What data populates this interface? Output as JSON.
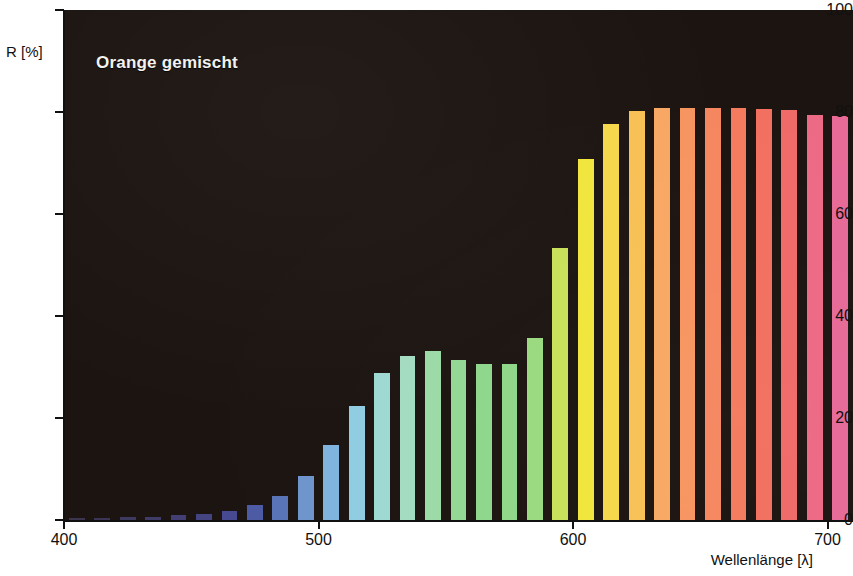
{
  "chart_data": {
    "type": "bar",
    "title": "Orange gemischt",
    "xlabel": "Wellenlänge [λ]",
    "ylabel": "R [%]",
    "xlim": [
      400,
      710
    ],
    "ylim": [
      0,
      100
    ],
    "grid": false,
    "legend": null,
    "background_color": "#1c1410",
    "x_tick_values": [
      400,
      500,
      600,
      700
    ],
    "x_tick_labels": [
      "400",
      "500",
      "600",
      "700"
    ],
    "y_tick_values": [
      0,
      20,
      40,
      60,
      80,
      100
    ],
    "y_tick_labels": [
      "0",
      "20",
      "40",
      "60",
      "80",
      "100"
    ],
    "x": [
      400,
      410,
      420,
      430,
      440,
      450,
      460,
      470,
      480,
      490,
      500,
      510,
      520,
      530,
      540,
      550,
      560,
      570,
      580,
      590,
      600,
      610,
      620,
      630,
      640,
      650,
      660,
      670,
      680,
      690,
      700
    ],
    "values": [
      0.4,
      0.4,
      0.5,
      0.6,
      0.9,
      1.2,
      1.7,
      2.9,
      4.7,
      8.6,
      14.8,
      22.4,
      28.9,
      32.2,
      33.2,
      31.4,
      30.6,
      30.5,
      35.6,
      53.3,
      70.8,
      77.7,
      80.2,
      80.7,
      80.8,
      80.8,
      80.7,
      80.5,
      80.3,
      79.4,
      79.3
    ],
    "bar_colors": [
      "#3b3550",
      "#3c3656",
      "#3e395f",
      "#403c68",
      "#433f74",
      "#454482",
      "#474a92",
      "#4d5ba5",
      "#5a74b8",
      "#6f95cd",
      "#7fb4de",
      "#8fcce2",
      "#9dd9d2",
      "#a3dcc1",
      "#9bdaa6",
      "#93d894",
      "#8fd78d",
      "#8fd789",
      "#9ada7f",
      "#c8e159",
      "#f0e63c",
      "#f5d84a",
      "#f7c155",
      "#f8a863",
      "#f79560",
      "#f58760",
      "#f47b5e",
      "#f2705f",
      "#f06a68",
      "#ec6a85",
      "#e76a97"
    ]
  }
}
